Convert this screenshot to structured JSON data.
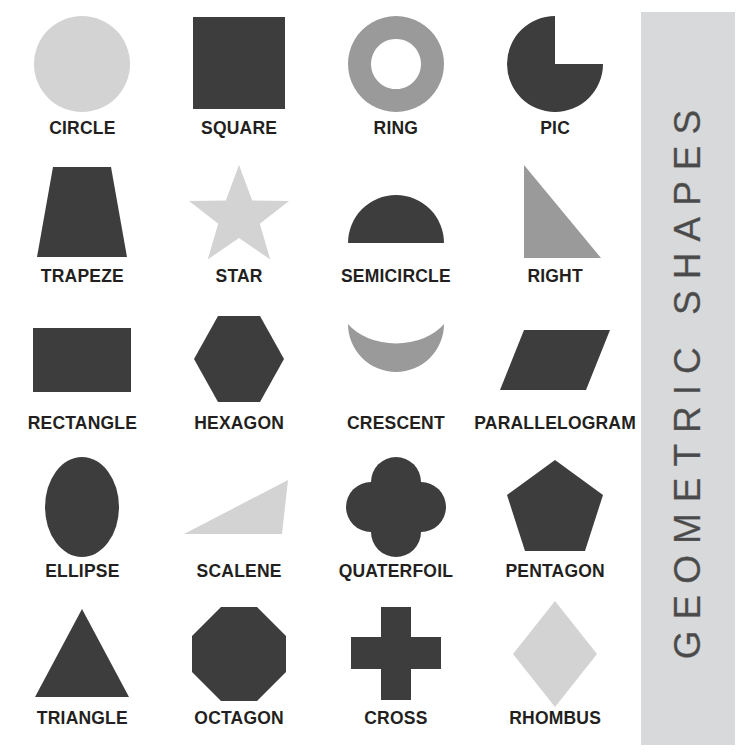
{
  "poster": {
    "background_color": "#ffffff",
    "width": 753,
    "height": 754
  },
  "side_banner": {
    "title": "GEOMETRIC SHAPES",
    "background_color": "#d8d9da",
    "text_color": "#4a4a4a",
    "orientation": "vertical-bottom-to-top"
  },
  "palette": {
    "dark": "#3d3d3d",
    "medium": "#9a9a9a",
    "light": "#d3d3d3",
    "label": "#231f20"
  },
  "grid": {
    "columns": 4,
    "rows": 5
  },
  "shapes": [
    {
      "label": "CIRCLE",
      "icon": "circle-shape",
      "tone": "light"
    },
    {
      "label": "SQUARE",
      "icon": "square-shape",
      "tone": "dark"
    },
    {
      "label": "RING",
      "icon": "ring-shape",
      "tone": "medium"
    },
    {
      "label": "PIC",
      "icon": "pie-shape",
      "tone": "dark"
    },
    {
      "label": "TRAPEZE",
      "icon": "trapezoid-shape",
      "tone": "dark"
    },
    {
      "label": "STAR",
      "icon": "star-shape",
      "tone": "light"
    },
    {
      "label": "SEMICIRCLE",
      "icon": "semicircle-shape",
      "tone": "dark"
    },
    {
      "label": "RIGHT",
      "icon": "right-triangle-shape",
      "tone": "medium"
    },
    {
      "label": "RECTANGLE",
      "icon": "rectangle-shape",
      "tone": "dark"
    },
    {
      "label": "HEXAGON",
      "icon": "hexagon-shape",
      "tone": "dark"
    },
    {
      "label": "CRESCENT",
      "icon": "crescent-shape",
      "tone": "medium"
    },
    {
      "label": "PARALLELOGRAM",
      "icon": "parallelogram-shape",
      "tone": "dark"
    },
    {
      "label": "ELLIPSE",
      "icon": "ellipse-shape",
      "tone": "dark"
    },
    {
      "label": "SCALENE",
      "icon": "scalene-triangle-shape",
      "tone": "light"
    },
    {
      "label": "QUATERFOIL",
      "icon": "quaterfoil-shape",
      "tone": "dark"
    },
    {
      "label": "PENTAGON",
      "icon": "pentagon-shape",
      "tone": "dark"
    },
    {
      "label": "TRIANGLE",
      "icon": "triangle-shape",
      "tone": "dark"
    },
    {
      "label": "OCTAGON",
      "icon": "octagon-shape",
      "tone": "dark"
    },
    {
      "label": "CROSS",
      "icon": "cross-shape",
      "tone": "dark"
    },
    {
      "label": "RHOMBUS",
      "icon": "rhombus-shape",
      "tone": "light"
    }
  ]
}
